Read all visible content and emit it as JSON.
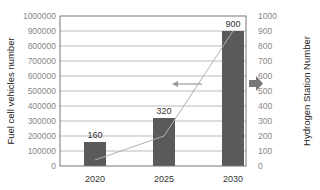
{
  "chart_data": {
    "type": "bar",
    "categories": [
      "2020",
      "2025",
      "2030"
    ],
    "series": [
      {
        "name": "Hydrogen Station Number",
        "kind": "bar",
        "axis": "right",
        "values": [
          160,
          320,
          900
        ],
        "data_labels": [
          "160",
          "320",
          "900"
        ],
        "color": "#5a5a5a"
      },
      {
        "name": "Fuel cell vehicles number",
        "kind": "line",
        "axis": "left",
        "values": [
          40000,
          200000,
          900000
        ],
        "color": "#b0b0b0"
      }
    ],
    "title": "",
    "xlabel": "",
    "ylabel": "Fuel cell vehicles number",
    "ylabel_right": "Hydrogen Station Number",
    "ylim": [
      0,
      1000000
    ],
    "ylim_right": [
      0,
      1000
    ],
    "yticks_left": [
      "0",
      "100000",
      "200000",
      "300000",
      "400000",
      "500000",
      "600000",
      "700000",
      "800000",
      "900000",
      "1000000"
    ],
    "yticks_right": [
      "0",
      "100",
      "200",
      "300",
      "400",
      "500",
      "600",
      "700",
      "800",
      "900",
      "1000"
    ],
    "grid": true,
    "annotations": [
      {
        "type": "arrow",
        "direction": "left",
        "meaning": "line refers to left axis"
      },
      {
        "type": "arrow",
        "direction": "right",
        "meaning": "bars refer to right axis"
      }
    ]
  }
}
